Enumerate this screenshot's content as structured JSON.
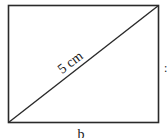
{
  "diagram": {
    "shape": "rectangle",
    "diagonal_label": "5 cm",
    "bottom_side_label": "b",
    "right_side_label": ":",
    "stroke_color": "#2a2a2a",
    "background": "#ffffff"
  }
}
